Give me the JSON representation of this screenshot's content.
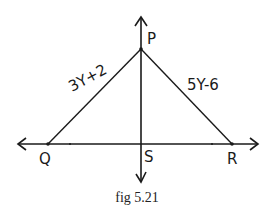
{
  "figure": {
    "caption": "fig 5.21",
    "points": {
      "P": {
        "label": "P"
      },
      "Q": {
        "label": "Q"
      },
      "R": {
        "label": "R"
      },
      "S": {
        "label": "S"
      }
    },
    "sides": {
      "PQ": {
        "label": "3Y+2"
      },
      "PR": {
        "label": "5Y-6"
      }
    },
    "colors": {
      "stroke": "#1a1a1a",
      "background": "#ffffff"
    }
  }
}
